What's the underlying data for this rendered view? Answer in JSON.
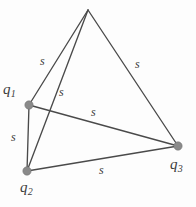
{
  "figure": {
    "background_color": "#fdfdfd",
    "line_color": "#4a4a4a",
    "vertex_color": "#8a8a8a",
    "text_color": "#3b3b3b",
    "width": 196,
    "height": 207
  },
  "vertices": [
    {
      "id": "apex",
      "label": "",
      "sub": "",
      "x": 88,
      "y": 10,
      "labeled": false,
      "dot": false
    },
    {
      "id": "q1",
      "label": "q",
      "sub": "1",
      "x": 29,
      "y": 105,
      "labeled": true,
      "dot": true,
      "label_x": 3,
      "label_y": 82
    },
    {
      "id": "q2",
      "label": "q",
      "sub": "2",
      "x": 27,
      "y": 171,
      "labeled": true,
      "dot": true,
      "label_x": 20,
      "label_y": 180
    },
    {
      "id": "q3",
      "label": "q",
      "sub": "3",
      "x": 178,
      "y": 146,
      "labeled": true,
      "dot": true,
      "label_x": 170,
      "label_y": 157
    }
  ],
  "edges": [
    {
      "id": "apex-q1",
      "from": "apex",
      "to": "q1",
      "label": "s",
      "label_x": 40,
      "label_y": 55
    },
    {
      "id": "apex-q3",
      "from": "apex",
      "to": "q3",
      "label": "s",
      "label_x": 135,
      "label_y": 58
    },
    {
      "id": "apex-q2",
      "from": "apex",
      "to": "q2",
      "label": "s",
      "label_x": 59,
      "label_y": 86
    },
    {
      "id": "q1-q3",
      "from": "q1",
      "to": "q3",
      "label": "s",
      "label_x": 91,
      "label_y": 106
    },
    {
      "id": "q1-q2",
      "from": "q1",
      "to": "q2",
      "label": "s",
      "label_x": 11,
      "label_y": 131
    },
    {
      "id": "q2-q3",
      "from": "q2",
      "to": "q3",
      "label": "s",
      "label_x": 99,
      "label_y": 164
    }
  ]
}
